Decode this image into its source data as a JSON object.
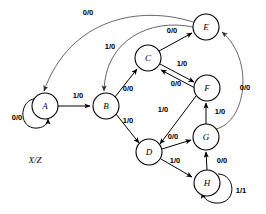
{
  "diagram": {
    "legend": "X/Z",
    "colors": {
      "stroke": "#000000",
      "fill": "#ffffff",
      "arc": "#555555"
    },
    "nodes": [
      {
        "id": "A",
        "label": "A",
        "cx": 45,
        "cy": 106,
        "r": 13
      },
      {
        "id": "B",
        "label": "B",
        "cx": 106,
        "cy": 106,
        "r": 13
      },
      {
        "id": "C",
        "label": "C",
        "cx": 148,
        "cy": 58,
        "r": 13
      },
      {
        "id": "D",
        "label": "D",
        "cx": 149,
        "cy": 152,
        "r": 13
      },
      {
        "id": "E",
        "label": "E",
        "cx": 206,
        "cy": 27,
        "r": 13
      },
      {
        "id": "F",
        "label": "F",
        "cx": 207,
        "cy": 88,
        "r": 13
      },
      {
        "id": "G",
        "label": "G",
        "cx": 206,
        "cy": 137,
        "r": 13
      },
      {
        "id": "H",
        "label": "H",
        "cx": 207,
        "cy": 183,
        "r": 13
      }
    ],
    "edges": [
      {
        "from": "A",
        "to": "A",
        "label": "0/0",
        "lx": 17,
        "ly": 120,
        "kind": "self-loop"
      },
      {
        "from": "A",
        "to": "B",
        "label": "1/0",
        "lx": 78,
        "ly": 98,
        "kind": "straight"
      },
      {
        "from": "B",
        "to": "C",
        "label": "0/0",
        "lx": 128,
        "ly": 91,
        "kind": "straight"
      },
      {
        "from": "B",
        "to": "D",
        "label": "1/0",
        "lx": 128,
        "ly": 123,
        "kind": "straight"
      },
      {
        "from": "C",
        "to": "E",
        "label": "0/0",
        "lx": 172,
        "ly": 33,
        "kind": "straight"
      },
      {
        "from": "C",
        "to": "F",
        "label": "1/0",
        "lx": 182,
        "ly": 66,
        "kind": "straight"
      },
      {
        "from": "F",
        "to": "C",
        "label": "0/0",
        "lx": 176,
        "ly": 84,
        "kind": "straight"
      },
      {
        "from": "F",
        "to": "D",
        "label": "1/0",
        "lx": 163,
        "ly": 112,
        "kind": "straight"
      },
      {
        "from": "D",
        "to": "G",
        "label": "0/0",
        "lx": 173,
        "ly": 138,
        "kind": "straight"
      },
      {
        "from": "D",
        "to": "H",
        "label": "1/0",
        "lx": 175,
        "ly": 162,
        "kind": "straight"
      },
      {
        "from": "G",
        "to": "F",
        "label": "1/0",
        "lx": 220,
        "ly": 114,
        "kind": "straight"
      },
      {
        "from": "H",
        "to": "G",
        "label": "0/0",
        "lx": 222,
        "ly": 162,
        "kind": "straight"
      },
      {
        "from": "H",
        "to": "H",
        "label": "1/1",
        "lx": 240,
        "ly": 192,
        "kind": "self-loop"
      },
      {
        "from": "G",
        "to": "E",
        "label": "0/0",
        "lx": 244,
        "ly": 90,
        "kind": "arc-right"
      },
      {
        "from": "E",
        "to": "A",
        "label": "0/0",
        "lx": 88,
        "ly": 14,
        "kind": "arc-long"
      },
      {
        "from": "E",
        "to": "B",
        "label": "1/0",
        "lx": 110,
        "ly": 48,
        "kind": "arc-long"
      }
    ]
  }
}
